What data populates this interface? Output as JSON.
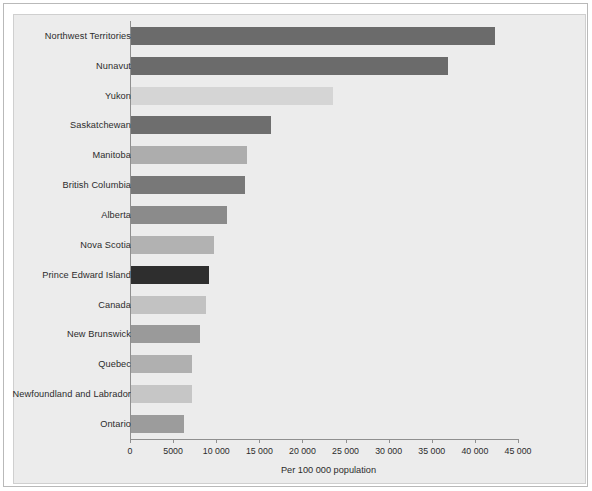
{
  "chart_data": {
    "type": "bar",
    "orientation": "horizontal",
    "title": "",
    "xlabel": "Per 100 000 population",
    "ylabel": "",
    "xlim": [
      0,
      45000
    ],
    "xticks": [
      0,
      5000,
      10000,
      15000,
      20000,
      25000,
      30000,
      35000,
      40000,
      45000
    ],
    "xtick_labels": [
      "0",
      "5000",
      "10 000",
      "15 000",
      "20 000",
      "25 000",
      "30 000",
      "35 000",
      "40 000",
      "45 000"
    ],
    "grid": false,
    "legend": "none",
    "categories": [
      "Northwest Territories",
      "Nunavut",
      "Yukon",
      "Saskatchewan",
      "Manitoba",
      "British Columbia",
      "Alberta",
      "Nova Scotia",
      "Prince Edward Island",
      "Canada",
      "New Brunswick",
      "Quebec",
      "Newfoundland and Labrador",
      "Ontario"
    ],
    "values": [
      42200,
      36800,
      23400,
      16200,
      13500,
      13200,
      11100,
      9600,
      9100,
      8700,
      8000,
      7100,
      7050,
      6150
    ],
    "bar_colors": [
      "#6b6b6b",
      "#6b6b6b",
      "#d5d5d5",
      "#6e6e6e",
      "#adadad",
      "#787878",
      "#8b8b8b",
      "#b2b2b2",
      "#2e2e2e",
      "#c2c2c2",
      "#9a9a9a",
      "#b0b0b0",
      "#c6c6c6",
      "#9c9c9c"
    ]
  },
  "colors": {
    "panel_background": "#ececec",
    "page_background": "#ffffff",
    "axis": "#8f8f8f",
    "text": "#2b2b2b",
    "frame_border": "#b9b9b9"
  }
}
